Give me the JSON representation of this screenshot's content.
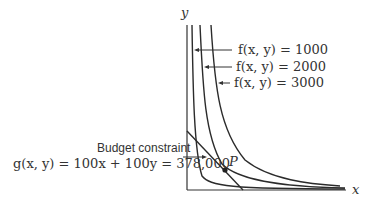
{
  "diagram": {
    "axes": {
      "x_label": "x",
      "y_label": "y"
    },
    "level_curves": [
      {
        "label": "f(x, y) = 1000",
        "value": 1000
      },
      {
        "label": "f(x, y) = 2000",
        "value": 2000
      },
      {
        "label": "f(x, y) = 3000",
        "value": 3000
      }
    ],
    "constraint": {
      "title": "Budget constraint",
      "equation": "g(x, y) = 100x + 100y = 378,000"
    },
    "point": {
      "label": "P"
    }
  }
}
